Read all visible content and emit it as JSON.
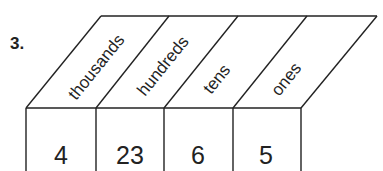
{
  "problem": {
    "number": "3."
  },
  "place_value_chart": {
    "columns": [
      {
        "label": "thousands",
        "value": "4"
      },
      {
        "label": "hundreds",
        "value": "23"
      },
      {
        "label": "tens",
        "value": "6"
      },
      {
        "label": "ones",
        "value": "5"
      }
    ]
  }
}
